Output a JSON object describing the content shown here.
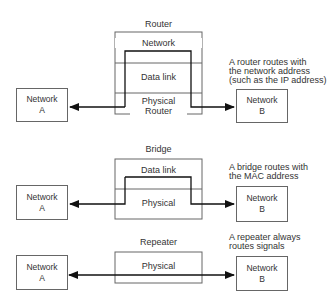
{
  "router": {
    "title": "Router",
    "layers": [
      "Network",
      "Data link",
      "Physical",
      "Router"
    ],
    "network_a": {
      "line1": "Network",
      "line2": "A"
    },
    "network_b": {
      "line1": "Network",
      "line2": "B"
    },
    "note": [
      "A router routes with",
      "the network address",
      "(such as the IP address)"
    ]
  },
  "bridge": {
    "title": "Bridge",
    "layers": [
      "Data link",
      "Physical"
    ],
    "network_a": {
      "line1": "Network",
      "line2": "A"
    },
    "network_b": {
      "line1": "Network",
      "line2": "B"
    },
    "note": [
      "A bridge routes with",
      "the MAC address"
    ]
  },
  "repeater": {
    "title": "Repeater",
    "layers": [
      "Physical"
    ],
    "network_a": {
      "line1": "Network",
      "line2": "A"
    },
    "network_b": {
      "line1": "Network",
      "line2": "B"
    },
    "note": [
      "A repeater always",
      "routes signals"
    ]
  },
  "colors": {
    "line": "#111111",
    "box_border": "#666666",
    "text": "#333333"
  }
}
